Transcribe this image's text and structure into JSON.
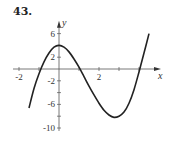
{
  "problem_number": "43.",
  "chart_data": {
    "type": "line",
    "title": "",
    "xlabel": "x",
    "ylabel": "y",
    "xlim": [
      -2.3,
      4.8
    ],
    "ylim": [
      -10.5,
      7.5
    ],
    "x_ticks": [
      -2,
      -1,
      1,
      2,
      3,
      4
    ],
    "x_tick_labels": [
      {
        "value": -2,
        "label": "-2"
      },
      {
        "value": 2,
        "label": "2"
      }
    ],
    "y_ticks": [
      -10,
      -8,
      -6,
      -4,
      -2,
      2,
      4,
      6
    ],
    "y_tick_labels": [
      {
        "value": 6,
        "label": "6"
      },
      {
        "value": 2,
        "label": "2"
      },
      {
        "value": -2,
        "label": "-2"
      },
      {
        "value": -6,
        "label": "-6"
      },
      {
        "value": -10,
        "label": "-10"
      }
    ],
    "grid": false,
    "legend": null,
    "series": [
      {
        "name": "f(x)",
        "x": [
          -1.5,
          -1.25,
          -1.0,
          -0.75,
          -0.5,
          -0.25,
          0,
          0.25,
          0.5,
          0.75,
          1.0,
          1.25,
          1.5,
          1.75,
          2.0,
          2.25,
          2.5,
          2.75,
          3.0,
          3.25,
          3.5,
          3.75,
          4.0,
          4.25,
          4.5
        ],
        "y": [
          -6.6,
          -3.3,
          -0.8,
          1.2,
          2.7,
          3.7,
          4.0,
          3.7,
          2.9,
          1.7,
          0.3,
          -1.3,
          -2.9,
          -4.4,
          -5.8,
          -7.0,
          -7.8,
          -8.2,
          -8.0,
          -7.3,
          -5.8,
          -3.5,
          -0.5,
          2.7,
          6.0
        ]
      }
    ]
  }
}
